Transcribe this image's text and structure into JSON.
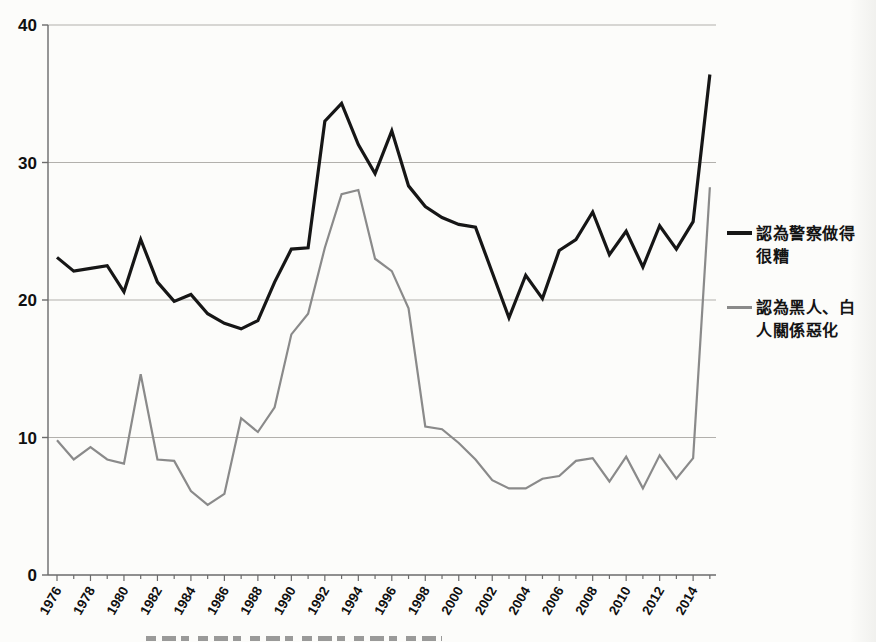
{
  "chart_data": {
    "type": "line",
    "title": "",
    "x": [
      1976,
      1977,
      1978,
      1979,
      1980,
      1981,
      1982,
      1983,
      1984,
      1985,
      1986,
      1987,
      1988,
      1989,
      1990,
      1991,
      1992,
      1993,
      1994,
      1995,
      1996,
      1997,
      1998,
      1999,
      2000,
      2001,
      2002,
      2003,
      2004,
      2005,
      2006,
      2007,
      2008,
      2009,
      2010,
      2011,
      2012,
      2013,
      2014,
      2015
    ],
    "series": [
      {
        "id": "police-bad-job-line",
        "name": "認為警察做得很糟",
        "color": "#161616",
        "width": 3.2,
        "values": [
          23.1,
          22.1,
          22.3,
          22.5,
          20.6,
          24.4,
          21.3,
          19.9,
          20.4,
          19.0,
          18.3,
          17.9,
          18.5,
          21.3,
          23.7,
          23.8,
          33.0,
          34.3,
          31.3,
          29.2,
          32.3,
          28.3,
          26.8,
          26.0,
          25.5,
          25.3,
          22.0,
          18.7,
          21.8,
          20.1,
          23.6,
          24.4,
          26.4,
          23.3,
          25.0,
          22.4,
          25.4,
          23.7,
          25.7,
          36.4
        ]
      },
      {
        "id": "race-relations-worse-line",
        "name": "認為黑人、白人關係惡化",
        "color": "#8a8a8a",
        "width": 2.2,
        "values": [
          9.8,
          8.4,
          9.3,
          8.4,
          8.1,
          14.6,
          8.4,
          8.3,
          6.1,
          5.1,
          5.9,
          11.4,
          10.4,
          12.2,
          17.5,
          19.0,
          23.8,
          27.7,
          28.0,
          23.0,
          22.1,
          19.4,
          10.8,
          10.6,
          9.6,
          8.4,
          6.9,
          6.3,
          6.3,
          7.0,
          7.2,
          8.3,
          8.5,
          6.8,
          8.6,
          6.3,
          8.7,
          7.0,
          8.5,
          28.2
        ]
      }
    ],
    "ylim": [
      0,
      40
    ],
    "yticks": [
      0,
      10,
      20,
      30,
      40
    ],
    "xtick_labels": [
      "1976",
      "1978",
      "1980",
      "1982",
      "1984",
      "1986",
      "1988",
      "1990",
      "1992",
      "1994",
      "1996",
      "1998",
      "2000",
      "2002",
      "2004",
      "2006",
      "2008",
      "2010",
      "2012",
      "2014"
    ],
    "grid": "horizontal",
    "legend_position": "right",
    "axis_color": "#6b6b6b",
    "gridline_color": "#b2b0ac",
    "label_color": "#101010"
  }
}
